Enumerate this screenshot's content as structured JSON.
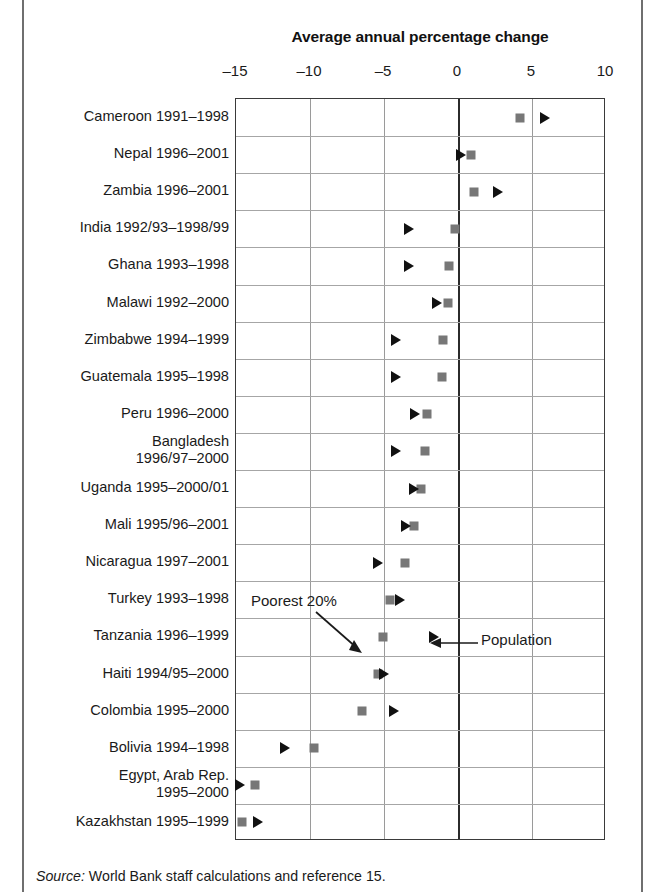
{
  "chart_data": {
    "type": "scatter",
    "title": "Average annual percentage change",
    "xlabel": "",
    "ylabel": "",
    "xlim": [
      -15,
      10
    ],
    "ticks": [
      -15,
      -10,
      -5,
      0,
      5,
      10
    ],
    "tick_labels": [
      "–15",
      "–10",
      "–5",
      "0",
      "5",
      "10"
    ],
    "grid": "vertical-and-horizontal",
    "legend_position": "inline-annotations",
    "series": [
      {
        "name": "Poorest 20%",
        "marker": "square",
        "color": "#777777"
      },
      {
        "name": "Population",
        "marker": "triangle",
        "color": "#111111"
      }
    ],
    "categories": [
      "Cameroon 1991–1998",
      "Nepal 1996–2001",
      "Zambia 1996–2001",
      "India 1992/93–1998/99",
      "Ghana 1993–1998",
      "Malawi 1992–2000",
      "Zimbabwe 1994–1999",
      "Guatemala 1995–1998",
      "Peru 1996–2000",
      "Bangladesh\n1996/97–2000",
      "Uganda 1995–2000/01",
      "Mali 1995/96–2001",
      "Nicaragua 1997–2001",
      "Turkey 1993–1998",
      "Tanzania 1996–1999",
      "Haiti 1994/95–2000",
      "Colombia 1995–2000",
      "Bolivia 1994–1998",
      "Egypt, Arab Rep.\n1995–2000",
      "Kazakhstan 1995–1999"
    ],
    "rows": [
      {
        "label": "Cameroon 1991–1998",
        "poorest": 4.2,
        "population": 5.9
      },
      {
        "label": "Nepal 1996–2001",
        "poorest": 0.9,
        "population": 0.2
      },
      {
        "label": "Zambia 1996–2001",
        "poorest": 1.1,
        "population": 2.7
      },
      {
        "label": "India 1992/93–1998/99",
        "poorest": -0.2,
        "population": -3.3
      },
      {
        "label": "Ghana 1993–1998",
        "poorest": -0.6,
        "population": -3.3
      },
      {
        "label": "Malawi 1992–2000",
        "poorest": -0.7,
        "population": -1.4
      },
      {
        "label": "Zimbabwe 1994–1999",
        "poorest": -1.0,
        "population": -4.2
      },
      {
        "label": "Guatemala 1995–1998",
        "poorest": -1.1,
        "population": -4.2
      },
      {
        "label": "Peru 1996–2000",
        "poorest": -2.1,
        "population": -2.9
      },
      {
        "label": "Bangladesh\n1996/97–2000",
        "poorest": -2.2,
        "population": -4.2
      },
      {
        "label": "Uganda 1995–2000/01",
        "poorest": -2.5,
        "population": -3.0
      },
      {
        "label": "Mali 1995/96–2001",
        "poorest": -3.0,
        "population": -3.5
      },
      {
        "label": "Nicaragua 1997–2001",
        "poorest": -3.6,
        "population": -5.4
      },
      {
        "label": "Turkey 1993–1998",
        "poorest": -4.6,
        "population": -3.9
      },
      {
        "label": "Tanzania 1996–1999",
        "poorest": -5.1,
        "population": -1.6
      },
      {
        "label": "Haiti 1994/95–2000",
        "poorest": -5.4,
        "population": -5.0
      },
      {
        "label": "Colombia 1995–2000",
        "poorest": -6.5,
        "population": -4.3
      },
      {
        "label": "Bolivia 1994–1998",
        "poorest": -9.7,
        "population": -11.7
      },
      {
        "label": "Egypt, Arab Rep.\n1995–2000",
        "poorest": -13.7,
        "population": -14.7
      },
      {
        "label": "Kazakhstan 1995–1999",
        "poorest": -14.6,
        "population": -13.5
      }
    ],
    "annotations": [
      {
        "text": "Poorest 20%",
        "points_to": "Tanzania poorest-20% square"
      },
      {
        "text": "Population",
        "points_to": "Tanzania population triangle"
      }
    ]
  },
  "source": {
    "label": "Source:",
    "text": "World Bank staff calculations and reference 15."
  }
}
